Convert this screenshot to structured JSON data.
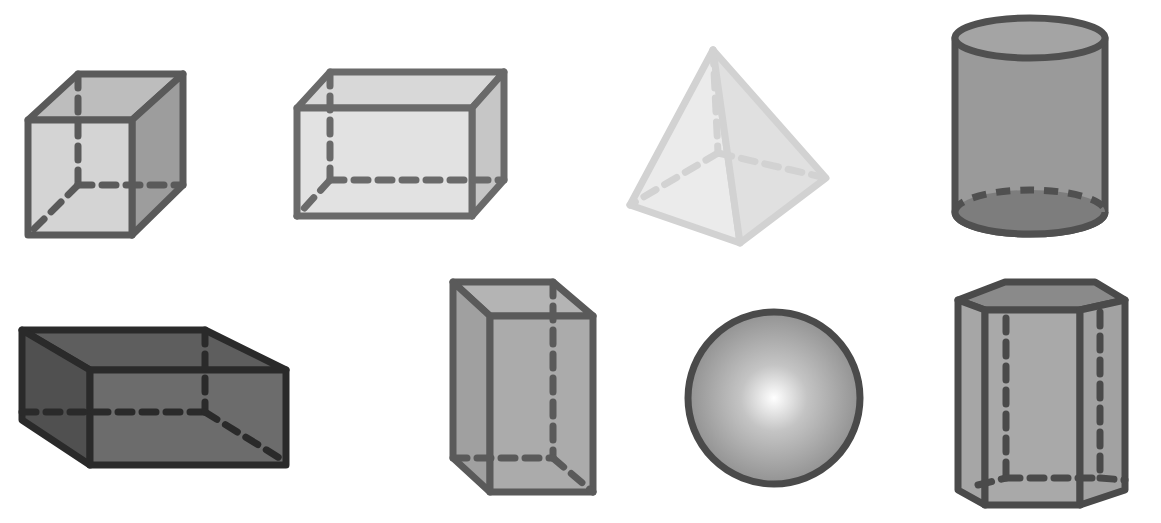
{
  "diagram": {
    "type": "3d-geometric-solids",
    "background": "#ffffff",
    "stroke_color": "#4a4a4a",
    "shapes": [
      {
        "id": "cube",
        "label": "Cube",
        "row": 1,
        "col": 1,
        "fill": "#c8c8c8"
      },
      {
        "id": "rectangular-prism-wide",
        "label": "Rectangular prism",
        "row": 1,
        "col": 2,
        "fill": "#dcdcdc"
      },
      {
        "id": "square-pyramid",
        "label": "Square pyramid",
        "row": 1,
        "col": 3,
        "fill": "#e6e6e6"
      },
      {
        "id": "cylinder",
        "label": "Cylinder",
        "row": 1,
        "col": 4,
        "fill": "#9a9a9a"
      },
      {
        "id": "rectangular-prism-dark",
        "label": "Rectangular prism",
        "row": 2,
        "col": 1,
        "fill": "#707070"
      },
      {
        "id": "rectangular-prism-tall",
        "label": "Rectangular prism",
        "row": 2,
        "col": 2,
        "fill": "#a8a8a8"
      },
      {
        "id": "sphere",
        "label": "Sphere",
        "row": 2,
        "col": 3,
        "fill": "#b0b0b0"
      },
      {
        "id": "hexagonal-prism",
        "label": "Hexagonal prism",
        "row": 2,
        "col": 4,
        "fill": "#a0a0a0"
      }
    ]
  }
}
